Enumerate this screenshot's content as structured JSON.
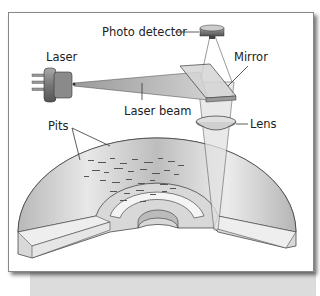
{
  "diagram": {
    "labels": {
      "photo_detector": "Photo detector",
      "laser": "Laser",
      "mirror": "Mirror",
      "laser_beam": "Laser beam",
      "pits": "Pits",
      "lens": "Lens"
    },
    "colors": {
      "frame_border": "#888888",
      "shadow": "#dcdcdc",
      "line": "#333333",
      "disc_fill": "#c8c8c8"
    }
  }
}
